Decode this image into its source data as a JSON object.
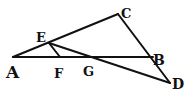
{
  "diagram": {
    "type": "geometry-figure",
    "stroke_color": "#111111",
    "background_color": "#ffffff",
    "points": {
      "A": {
        "label": "A"
      },
      "B": {
        "label": "B"
      },
      "C": {
        "label": "C"
      },
      "D": {
        "label": "D"
      },
      "E": {
        "label": "E"
      },
      "F": {
        "label": "F"
      },
      "G": {
        "label": "G"
      }
    },
    "segments": [
      {
        "from": "A",
        "to": "B"
      },
      {
        "from": "A",
        "to": "C"
      },
      {
        "from": "C",
        "to": "D"
      },
      {
        "from": "E",
        "to": "D"
      },
      {
        "from": "E",
        "to": "F"
      }
    ]
  }
}
